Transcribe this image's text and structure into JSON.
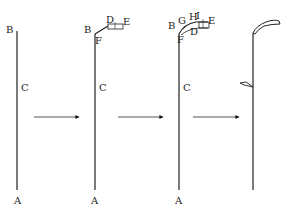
{
  "diagram": {
    "type": "process-sequence",
    "stages": [
      {
        "id": "stage-1",
        "labels": {
          "top": "B",
          "middle": "C",
          "bottom": "A"
        }
      },
      {
        "id": "stage-2",
        "labels": {
          "top": "B",
          "middle": "C",
          "bottom": "A",
          "joint": "F",
          "d": "D",
          "e": "E"
        }
      },
      {
        "id": "stage-3",
        "labels": {
          "top": "B",
          "middle": "C",
          "bottom": "A",
          "joint": "F",
          "g": "G",
          "h": "H",
          "i": "I",
          "d": "D",
          "e": "E"
        }
      },
      {
        "id": "stage-4",
        "labels": {}
      }
    ],
    "arrows": [
      {
        "from": "stage-1",
        "to": "stage-2"
      },
      {
        "from": "stage-2",
        "to": "stage-3"
      },
      {
        "from": "stage-3",
        "to": "stage-4"
      }
    ],
    "colors": {
      "line": "#222222",
      "background": "#ffffff"
    }
  }
}
